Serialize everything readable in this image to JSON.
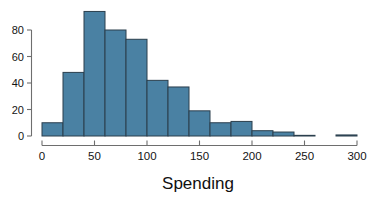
{
  "chart_data": {
    "type": "bar",
    "title": "",
    "subtitle": "",
    "xlabel": "Spending",
    "ylabel": "",
    "bin_width": 20,
    "bin_starts": [
      0,
      20,
      40,
      60,
      80,
      100,
      120,
      140,
      160,
      180,
      200,
      220,
      240,
      260,
      280
    ],
    "categories": [
      "0-20",
      "20-40",
      "40-60",
      "60-80",
      "80-100",
      "100-120",
      "120-140",
      "140-160",
      "160-180",
      "180-200",
      "200-220",
      "220-240",
      "240-260",
      "260-280",
      "280-300"
    ],
    "values": [
      10,
      48,
      94,
      80,
      73,
      42,
      37,
      19,
      10,
      11,
      4,
      3,
      0.5,
      0,
      0.8
    ],
    "xlim": [
      0,
      300
    ],
    "ylim": [
      0,
      94
    ],
    "xticks": [
      0,
      50,
      100,
      150,
      200,
      250,
      300
    ],
    "xtick_labels": [
      "0",
      "50",
      "100",
      "150",
      "200",
      "250",
      "300"
    ],
    "yticks": [
      0,
      20,
      40,
      60,
      80
    ],
    "ytick_labels": [
      "0",
      "20",
      "40",
      "60",
      "80"
    ],
    "grid": false,
    "legend": null,
    "bar_color": "#4a81a3",
    "bar_edge_color": "#2b3f4d",
    "axis_color": "#6e6e6e"
  },
  "labels": {
    "x_axis_title": "Spending",
    "y0": "0",
    "y20": "20",
    "y40": "40",
    "y60": "60",
    "y80": "80",
    "x0": "0",
    "x50": "50",
    "x100": "100",
    "x150": "150",
    "x200": "200",
    "x250": "250",
    "x300": "300"
  }
}
